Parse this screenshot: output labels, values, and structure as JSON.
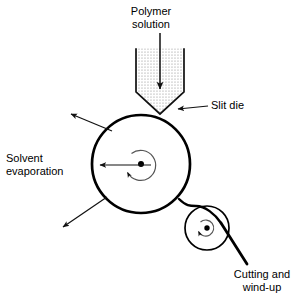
{
  "figure": {
    "type": "process-flow-diagram",
    "background_color": "#ffffff",
    "line_color": "#000000",
    "arrow_color": "#1a1a1a",
    "fill_pattern": "stipple-dots"
  },
  "labels": {
    "polymer_solution": "Polymer\nsolution",
    "slit_die": "Slit die",
    "solvent_evaporation": "Solvent\nevaporation",
    "cutting_and_windup": "Cutting and\nwind-up"
  },
  "components": {
    "die": {
      "name": "slit-die",
      "shape": "rectangular hopper with V-shaped tapered outlet",
      "top_y": 47,
      "left_x": 136,
      "right_x": 184,
      "taper_start_y": 92,
      "tip": [
        160,
        114
      ],
      "fill": "stippled"
    },
    "casting_drum": {
      "name": "casting-drum",
      "shape": "circle",
      "center": [
        141,
        164
      ],
      "radius": 49,
      "stroke_width": 2.6,
      "hub_dot_radius": 3,
      "rotation": "clockwise"
    },
    "take_up_roller": {
      "name": "take-up-roller",
      "shape": "circle",
      "center": [
        207,
        228
      ],
      "radius": 22,
      "stroke_width": 1.6,
      "hub_dot_radius": 2.6,
      "rotation": "clockwise"
    },
    "web": {
      "name": "cast-film-web",
      "description": "film peels off drum, wraps over take-up roller and exits down-right"
    }
  },
  "arrows": {
    "feed": {
      "name": "polymer-feed-arrow",
      "from": [
        160,
        33
      ],
      "to": [
        160,
        89
      ],
      "direction": "down"
    },
    "slit_die_pointer": {
      "name": "slit-die-pointer",
      "from": [
        208,
        105
      ],
      "to": [
        178,
        108
      ],
      "direction": "left"
    },
    "solvent_pointer": {
      "name": "solvent-evaporation-pointer",
      "from": [
        150,
        165
      ],
      "to": [
        100,
        165
      ],
      "direction": "left"
    },
    "evaporation_rays": [
      {
        "name": "evaporation-ray-upper-left",
        "from": [
          110,
          130
        ],
        "to": [
          71,
          114
        ]
      },
      {
        "name": "evaporation-ray-lower-left",
        "from": [
          106,
          198
        ],
        "to": [
          62,
          228
        ]
      }
    ]
  },
  "colors": {
    "ink": "#000000",
    "paper": "#ffffff",
    "stipple": "#8c8c8c"
  }
}
